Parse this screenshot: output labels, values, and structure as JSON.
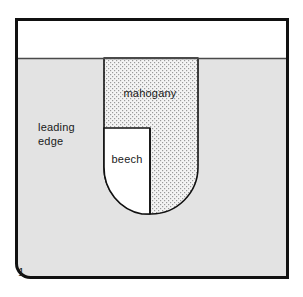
{
  "figure": {
    "number": "1",
    "regions": [
      {
        "id": "leading-edge",
        "label_line1": "leading",
        "label_line2": "edge",
        "fill": "#e3e3e3",
        "kind": "solid-gray"
      },
      {
        "id": "mahogany",
        "label": "mahogany",
        "fill": "#f2f2f2",
        "kind": "stipple-dotted"
      },
      {
        "id": "beech",
        "label": "beech",
        "fill": "#ffffff",
        "kind": "solid-white"
      },
      {
        "id": "top-band",
        "label": "",
        "fill": "#ffffff",
        "kind": "solid-white"
      }
    ],
    "colors": {
      "outline": "#111111",
      "gray_fill": "#e3e3e3",
      "white_fill": "#ffffff",
      "stipple_dot": "#9a9a9a",
      "divider": "#4a4a4a",
      "text": "#1a1a1a"
    },
    "geometry": {
      "frame": {
        "x": 15,
        "y": 18,
        "width": 274,
        "height": 261,
        "stroke_width": 3
      },
      "divider_y": 58,
      "insert": {
        "left_x": 104,
        "right_x": 198,
        "top_y": 58,
        "bottom_y": 214
      },
      "beech": {
        "left_x": 104,
        "right_x": 150,
        "top_y": 128,
        "bottom_y": 214
      },
      "corner_notch_radius": 14
    },
    "labels": {
      "mahogany_pos": {
        "x": 150,
        "y": 97
      },
      "beech_pos": {
        "x": 127,
        "y": 163
      },
      "leading_edge_pos": {
        "x": 38,
        "y": 131
      },
      "figure_number_pos": {
        "x": 18,
        "y": 276
      }
    }
  }
}
